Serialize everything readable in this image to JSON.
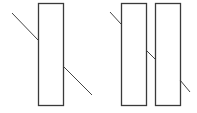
{
  "diagram": {
    "background": "#ffffff",
    "stroke_color": "#3a3a3a",
    "line_color": "#444444",
    "figures": [
      {
        "name": "single-slab",
        "rects": [
          {
            "x": 38,
            "y": 3,
            "w": 25,
            "h": 102
          }
        ],
        "segments": [
          {
            "x1": 12,
            "y1": 13,
            "x2": 38,
            "y2": 40
          },
          {
            "x1": 63,
            "y1": 66,
            "x2": 92,
            "y2": 95
          }
        ]
      },
      {
        "name": "double-slab",
        "rects": [
          {
            "x": 121,
            "y": 3,
            "w": 25,
            "h": 102
          },
          {
            "x": 155,
            "y": 3,
            "w": 25,
            "h": 102
          }
        ],
        "segments": [
          {
            "x1": 110,
            "y1": 12,
            "x2": 121,
            "y2": 24
          },
          {
            "x1": 146,
            "y1": 50,
            "x2": 155,
            "y2": 59
          },
          {
            "x1": 180,
            "y1": 80,
            "x2": 190,
            "y2": 92
          }
        ]
      }
    ]
  }
}
